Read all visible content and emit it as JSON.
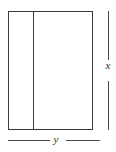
{
  "figure": {
    "background_color": "#ffffff",
    "stroke_color": "#3a3a3a",
    "dimension_stroke_color": "#4a4a4a",
    "label_color": "#2e2e2e",
    "shape": {
      "type": "rectangle",
      "name": "outer-rectangle",
      "left": 8,
      "top": 11,
      "width": 85,
      "height": 119
    },
    "divider": {
      "name": "interior-vertical-divider",
      "orientation": "vertical",
      "x": 33,
      "top": 11,
      "height": 119
    },
    "dimensions": [
      {
        "id": "height-dimension",
        "label": "x",
        "orientation": "vertical",
        "position": "right",
        "line_x": 108,
        "segment_top": {
          "top": 11,
          "height": 49
        },
        "segment_bottom": {
          "top": 81,
          "height": 49
        }
      },
      {
        "id": "width-dimension",
        "label": "y",
        "orientation": "horizontal",
        "position": "bottom",
        "line_y": 140,
        "segment_left": {
          "left": 8,
          "width": 42
        },
        "segment_right": {
          "left": 66,
          "width": 34
        }
      }
    ]
  }
}
